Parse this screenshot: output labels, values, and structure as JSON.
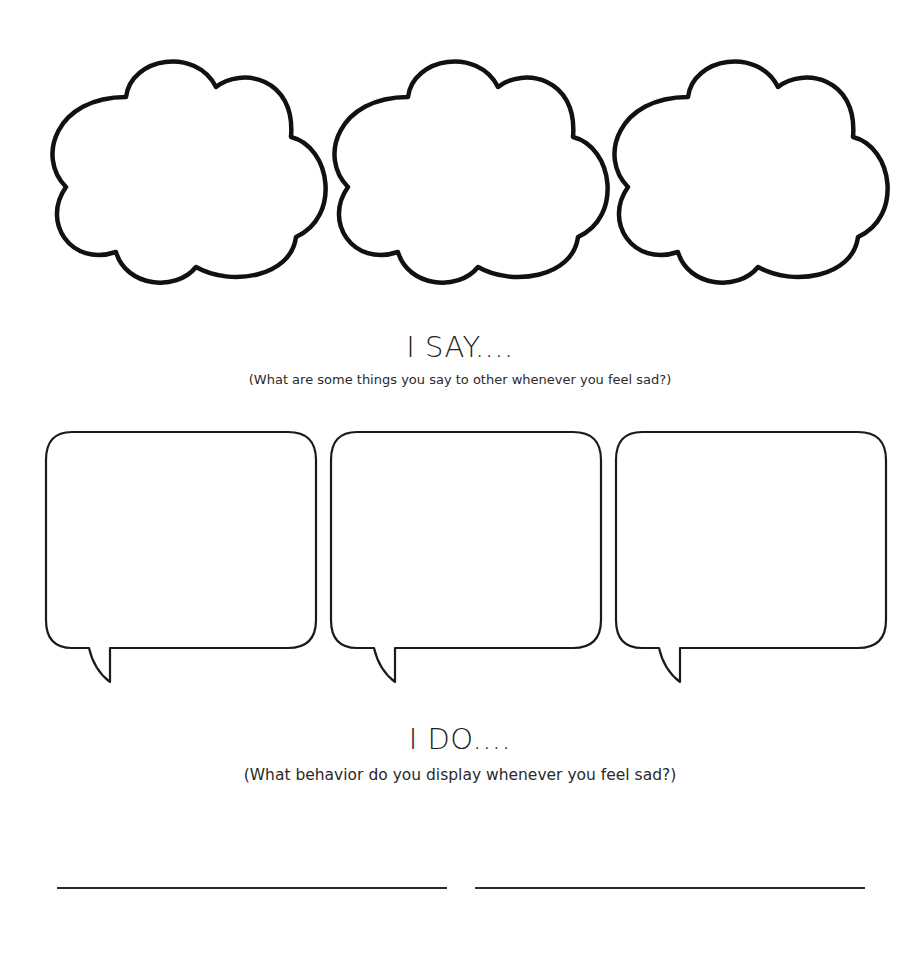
{
  "worksheet": {
    "think_section": {
      "clouds": [
        {
          "id": 1
        },
        {
          "id": 2
        },
        {
          "id": 3
        }
      ]
    },
    "say_section": {
      "heading": "I SAY....",
      "prompt": "(What are some things you say to other whenever you feel sad?)",
      "bubbles": [
        {
          "id": 1
        },
        {
          "id": 2
        },
        {
          "id": 3
        }
      ]
    },
    "do_section": {
      "heading": "I DO....",
      "prompt": "(What behavior do you display whenever you feel sad?)",
      "answer_lines": [
        {
          "id": 1
        },
        {
          "id": 2
        }
      ]
    }
  }
}
